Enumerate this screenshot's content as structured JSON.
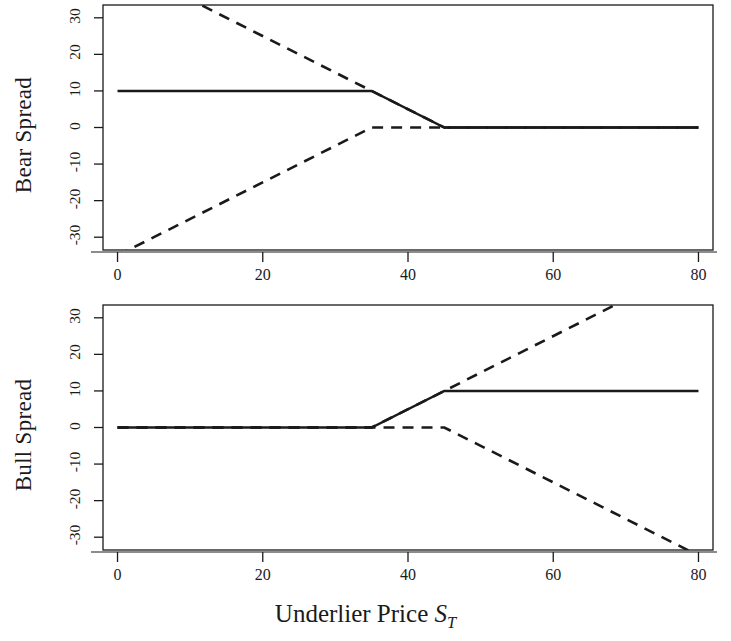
{
  "figure": {
    "width": 731,
    "height": 641,
    "background": "#ffffff",
    "ink": "#1a1a1a"
  },
  "xaxis": {
    "label_text": "Underlier Price ",
    "label_symbol": "S",
    "label_subscript": "T",
    "ticks": [
      0,
      20,
      40,
      60,
      80
    ],
    "tick_labels": [
      "0",
      "20",
      "40",
      "60",
      "80"
    ],
    "min": -2,
    "max": 82
  },
  "yaxis": {
    "ticks": [
      30,
      20,
      10,
      0,
      -10,
      -20,
      -30
    ],
    "tick_labels": [
      "30",
      "20",
      "10",
      "0",
      "-10",
      "-20",
      "-30"
    ],
    "min": -33.5,
    "max": 33.5
  },
  "panels": [
    {
      "id": "bear",
      "ylabel": "Bear Spread"
    },
    {
      "id": "bull",
      "ylabel": "Bull Spread"
    }
  ],
  "chart_data": [
    {
      "type": "line",
      "title": "Bear Spread",
      "xlabel": "Underlier Price S_T",
      "ylabel": "Bear Spread",
      "xlim": [
        -2,
        82
      ],
      "ylim": [
        -33.5,
        33.5
      ],
      "xticks": [
        0,
        20,
        40,
        60,
        80
      ],
      "yticks": [
        -30,
        -20,
        -10,
        0,
        10,
        20,
        30
      ],
      "grid": false,
      "legend": "none",
      "series": [
        {
          "name": "Bear spread payoff (net)",
          "style": "solid",
          "color": "#1a1a1a",
          "width": 2.4,
          "x": [
            0,
            35,
            45,
            80
          ],
          "y": [
            10,
            10,
            0,
            0
          ]
        },
        {
          "name": "Long put K=45",
          "style": "dashed",
          "color": "#1a1a1a",
          "width": 2.6,
          "x": [
            0,
            45,
            80
          ],
          "y": [
            45,
            0,
            0
          ]
        },
        {
          "name": "Short put K=35",
          "style": "dashed",
          "color": "#1a1a1a",
          "width": 2.6,
          "x": [
            0,
            35,
            80
          ],
          "y": [
            -35,
            0,
            0
          ]
        }
      ]
    },
    {
      "type": "line",
      "title": "Bull Spread",
      "xlabel": "Underlier Price S_T",
      "ylabel": "Bull Spread",
      "xlim": [
        -2,
        82
      ],
      "ylim": [
        -33.5,
        33.5
      ],
      "xticks": [
        0,
        20,
        40,
        60,
        80
      ],
      "yticks": [
        -30,
        -20,
        -10,
        0,
        10,
        20,
        30
      ],
      "grid": false,
      "legend": "none",
      "series": [
        {
          "name": "Bull spread payoff (net)",
          "style": "solid",
          "color": "#1a1a1a",
          "width": 2.4,
          "x": [
            0,
            35,
            45,
            80
          ],
          "y": [
            0,
            0,
            10,
            10
          ]
        },
        {
          "name": "Long call K=35",
          "style": "dashed",
          "color": "#1a1a1a",
          "width": 2.6,
          "x": [
            0,
            35,
            80
          ],
          "y": [
            0,
            0,
            45
          ]
        },
        {
          "name": "Short call K=45",
          "style": "dashed",
          "color": "#1a1a1a",
          "width": 2.6,
          "x": [
            0,
            45,
            80
          ],
          "y": [
            0,
            0,
            -35
          ]
        }
      ]
    }
  ]
}
